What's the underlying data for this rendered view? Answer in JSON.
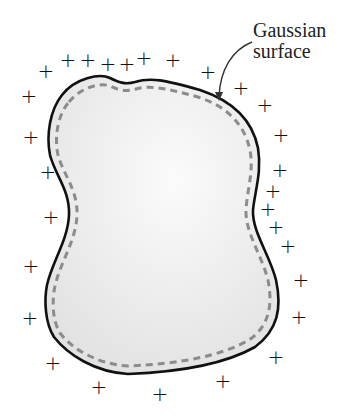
{
  "figure": {
    "label_line1": "Gaussian",
    "label_line2": "surface",
    "conductor_fill": "#eeeeee",
    "outline_color": "#111111",
    "dashed_color": "#8c8c8c",
    "plus_symbol": "+",
    "charges": [
      {
        "x": 46,
        "y": 71
      },
      {
        "x": 68,
        "y": 60
      },
      {
        "x": 88,
        "y": 60
      },
      {
        "x": 108,
        "y": 64
      },
      {
        "x": 127,
        "y": 64
      },
      {
        "x": 144,
        "y": 58
      },
      {
        "x": 173,
        "y": 60
      },
      {
        "x": 208,
        "y": 72
      },
      {
        "x": 241,
        "y": 88
      },
      {
        "x": 265,
        "y": 105
      },
      {
        "x": 29,
        "y": 96
      },
      {
        "x": 31,
        "y": 137
      },
      {
        "x": 281,
        "y": 135
      },
      {
        "x": 48,
        "y": 172
      },
      {
        "x": 280,
        "y": 170
      },
      {
        "x": 273,
        "y": 191
      },
      {
        "x": 51,
        "y": 217
      },
      {
        "x": 268,
        "y": 209
      },
      {
        "x": 276,
        "y": 227
      },
      {
        "x": 288,
        "y": 246
      },
      {
        "x": 31,
        "y": 266
      },
      {
        "x": 301,
        "y": 280
      },
      {
        "x": 30,
        "y": 318
      },
      {
        "x": 299,
        "y": 317
      },
      {
        "x": 53,
        "y": 363
      },
      {
        "x": 276,
        "y": 357
      },
      {
        "x": 99,
        "y": 387
      },
      {
        "x": 160,
        "y": 394
      },
      {
        "x": 223,
        "y": 381
      }
    ]
  }
}
